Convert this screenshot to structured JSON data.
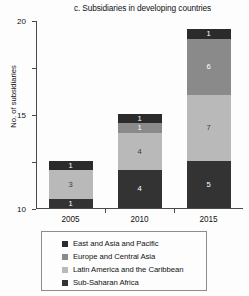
{
  "chart_data": {
    "type": "bar",
    "subtype": "stacked-bar",
    "title": "c. Subsidiaries in developing countries",
    "xlabel": "",
    "ylabel": "No. of subsidiaries",
    "categories": [
      "2005",
      "2010",
      "2015"
    ],
    "ylim": [
      0,
      20
    ],
    "yticks": [
      0,
      5,
      10,
      15,
      20
    ],
    "ytick_labels": [
      "0",
      "5",
      "10",
      "15",
      "20"
    ],
    "grid": false,
    "legend_position": "bottom",
    "stack_order": "bottom-to-top",
    "series": [
      {
        "name": "Sub-Saharan Africa",
        "color": "#333333",
        "values": [
          1,
          4,
          5
        ],
        "labels": [
          "1",
          "4",
          "5"
        ]
      },
      {
        "name": "Latin America and the Caribbean",
        "color": "#b9b9b9",
        "values": [
          3,
          4,
          7
        ],
        "labels": [
          "3",
          "4",
          "7"
        ]
      },
      {
        "name": "Europe and Central Asia",
        "color": "#8a8a8a",
        "values": [
          0,
          1,
          6
        ],
        "labels": [
          "",
          "1",
          "6"
        ]
      },
      {
        "name": "East and Asia and Pacific",
        "color": "#2b2b2b",
        "values": [
          1,
          1,
          1
        ],
        "labels": [
          "1",
          "1",
          "1"
        ]
      }
    ],
    "totals": [
      5,
      10,
      19
    ]
  },
  "legend": {
    "items": [
      {
        "label": "East and Asia and Pacific",
        "color": "#2b2b2b"
      },
      {
        "label": "Europe and Central Asia",
        "color": "#8a8a8a"
      },
      {
        "label": "Latin America and the Caribbean",
        "color": "#b9b9b9"
      },
      {
        "label": "Sub-Saharan Africa",
        "color": "#333333"
      }
    ]
  }
}
